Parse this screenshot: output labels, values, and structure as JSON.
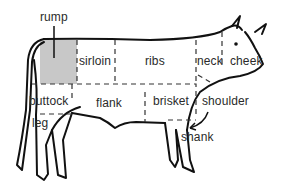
{
  "diagram": {
    "highlighted_cut": "rump",
    "colors": {
      "outline": "#111111",
      "divider": "#333333",
      "highlight": "#c8c8c8",
      "text": "#2a2a2a",
      "background": "#ffffff"
    },
    "labels": {
      "rump": "rump",
      "sirloin": "sirloin",
      "ribs": "ribs",
      "neck": "neck",
      "cheek": "cheek",
      "buttock": "buttock",
      "flank": "flank",
      "brisket": "brisket",
      "shoulder": "shoulder",
      "leg": "leg",
      "shank": "shank"
    }
  }
}
